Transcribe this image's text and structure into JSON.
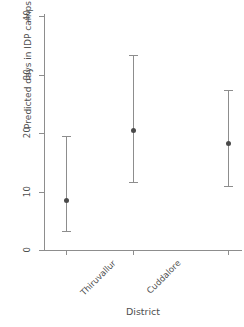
{
  "chart_data": {
    "type": "scatter",
    "title": "",
    "xlabel": "District",
    "ylabel": "Predicted days in IDP camps",
    "categories": [
      "Thiruvallur",
      "Cuddalore",
      "Nagapattinam"
    ],
    "values": [
      8.5,
      20.5,
      18.3
    ],
    "error_low": [
      3.3,
      11.7,
      10.9
    ],
    "error_high": [
      19.5,
      33.3,
      27.4
    ],
    "ylim": [
      0,
      40
    ],
    "yticks": [
      0,
      10,
      20,
      30,
      40
    ],
    "ytick_labels": [
      "0",
      "10",
      "20",
      "30",
      "40"
    ],
    "xtick_labels": [
      "Thiruvallur",
      "Cuddalore",
      "Nagapattinam"
    ],
    "grid": false,
    "legend": null,
    "marker": "filled-circle",
    "errorbar_style": "capped-vertical",
    "series": [
      {
        "name": "Predicted days in IDP camps",
        "points": [
          {
            "category": "Thiruvallur",
            "value": 8.5,
            "ci_low": 3.3,
            "ci_high": 19.5
          },
          {
            "category": "Cuddalore",
            "value": 20.5,
            "ci_low": 11.7,
            "ci_high": 33.3
          },
          {
            "category": "Nagapattinam",
            "value": 18.3,
            "ci_low": 10.9,
            "ci_high": 27.4
          }
        ]
      }
    ]
  },
  "axes": {
    "y_title": "Predicted days in IDP camps",
    "x_title": "District",
    "y_ticks": [
      {
        "label": "40",
        "value": 40
      },
      {
        "label": "30",
        "value": 30
      },
      {
        "label": "20",
        "value": 20
      },
      {
        "label": "10",
        "value": 10
      },
      {
        "label": "0",
        "value": 0
      }
    ],
    "x_ticks": [
      {
        "label": "Thiruvallur"
      },
      {
        "label": "Cuddalore"
      },
      {
        "label": "Nagapattinam"
      }
    ]
  },
  "colors": {
    "axis": "#8d8d8d",
    "text": "#4f4f4f",
    "marker": "#4a4a4a",
    "errorbar": "#8d8d8d",
    "background": "#ffffff"
  }
}
